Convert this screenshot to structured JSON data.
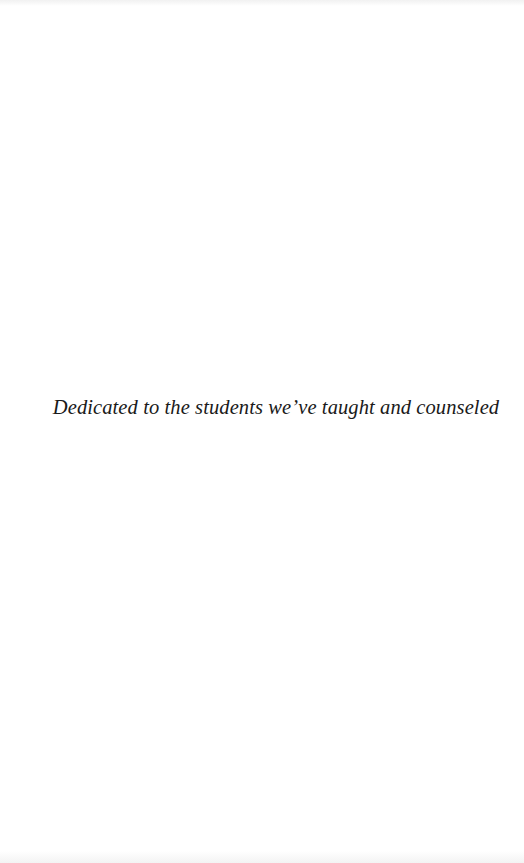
{
  "page": {
    "type": "dedication",
    "background_color": "#ffffff",
    "text_color": "#1a1a1a"
  },
  "dedication": {
    "text": "Dedicated to the students we’ve taught and counseled"
  }
}
